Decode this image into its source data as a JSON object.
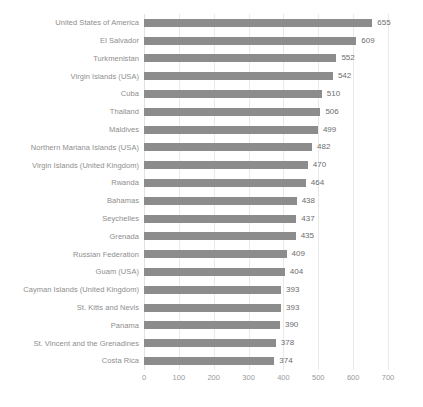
{
  "chart_data": {
    "type": "bar",
    "orientation": "horizontal",
    "title": "",
    "subtitle": "",
    "xlabel": "",
    "ylabel": "",
    "xlim": [
      0,
      700
    ],
    "xticks": [
      0,
      100,
      200,
      300,
      400,
      500,
      600,
      700
    ],
    "grid": true,
    "legend": false,
    "bar_color": "#8c8c8c",
    "label_color": "#8e8e8e",
    "value_color": "#6d6d6d",
    "tick_color": "#9a9a9a",
    "gridline_color": "#e9e9e9",
    "categories": [
      "United States of America",
      "El Salvador",
      "Turkmenistan",
      "Virgin Islands (USA)",
      "Cuba",
      "Thailand",
      "Maldives",
      "Northern Mariana Islands (USA)",
      "Virgin Islands (United Kingdom)",
      "Rwanda",
      "Bahamas",
      "Seychelles",
      "Grenada",
      "Russian Federation",
      "Guam (USA)",
      "Cayman Islands (United Kingdom)",
      "St. Kitts and Nevis",
      "Panama",
      "St. Vincent and the Grenadines",
      "Costa Rica"
    ],
    "values": [
      655,
      609,
      552,
      542,
      510,
      506,
      499,
      482,
      470,
      464,
      438,
      437,
      435,
      409,
      404,
      393,
      393,
      390,
      378,
      374
    ],
    "value_labels": [
      "655",
      "609",
      "552",
      "542",
      "510",
      "506",
      "499",
      "482",
      "470",
      "464",
      "438",
      "437",
      "435",
      "409",
      "404",
      "393",
      "393",
      "390",
      "378",
      "374"
    ],
    "xtick_labels": [
      "0",
      "100",
      "200",
      "300",
      "400",
      "500",
      "600",
      "700"
    ]
  }
}
